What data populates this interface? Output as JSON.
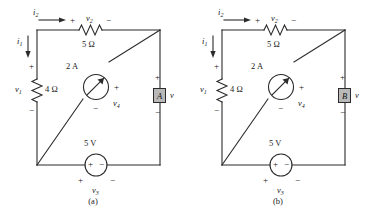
{
  "figure": {
    "panels": [
      {
        "id": "a",
        "caption": "(a)",
        "meter_label": "A",
        "elements": {
          "current_top": "i",
          "current_top_sub": "2",
          "current_left": "i",
          "current_left_sub": "1",
          "resistor_top_voltage": "v",
          "resistor_top_voltage_sub": "2",
          "resistor_top_value": "5 Ω",
          "resistor_left_voltage": "v",
          "resistor_left_voltage_sub": "1",
          "resistor_left_value": "4 Ω",
          "source_current_value": "2 A",
          "source_current_voltage": "v",
          "source_current_voltage_sub": "4",
          "source_voltage_value": "5 V",
          "source_voltage_label": "v",
          "source_voltage_label_sub": "3",
          "meter_voltage": "v",
          "plus": "+",
          "minus": "−"
        }
      },
      {
        "id": "b",
        "caption": "(b)",
        "meter_label": "B",
        "elements": {
          "current_top": "i",
          "current_top_sub": "2",
          "current_left": "i",
          "current_left_sub": "1",
          "resistor_top_voltage": "v",
          "resistor_top_voltage_sub": "2",
          "resistor_top_value": "5 Ω",
          "resistor_left_voltage": "v",
          "resistor_left_voltage_sub": "1",
          "resistor_left_value": "4 Ω",
          "source_current_value": "2 A",
          "source_current_voltage": "v",
          "source_current_voltage_sub": "4",
          "source_voltage_value": "5 V",
          "source_voltage_label": "v",
          "source_voltage_label_sub": "3",
          "meter_voltage": "v",
          "plus": "+",
          "minus": "−"
        }
      }
    ],
    "colors": {
      "wire": "#2b2b2b",
      "meter_fill": "#b9b9b9",
      "background": "#ffffff"
    }
  }
}
